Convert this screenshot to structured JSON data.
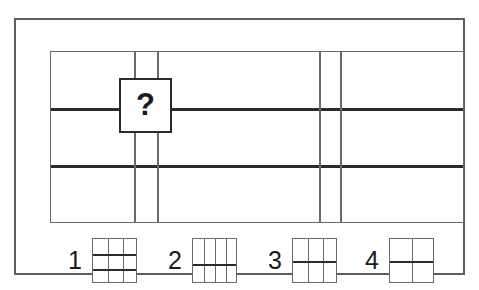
{
  "figure": {
    "type": "matrix-reasoning-puzzle",
    "question_mark": "?",
    "colors": {
      "background": "#ffffff",
      "frame": "#5d5d5d",
      "thin_line": "#6a6a6a",
      "thick_line": "#2b2b2b",
      "text": "#1a1a1a"
    }
  },
  "stimulus": {
    "name": "main-grid",
    "width": 414,
    "height": 172,
    "thick_horizontal_lines": [
      {
        "id": "h1",
        "y": 56
      },
      {
        "id": "h2",
        "y": 113
      }
    ],
    "thin_vertical_lines": [
      {
        "id": "v1",
        "x": 83
      },
      {
        "id": "v2",
        "x": 106
      },
      {
        "id": "v3",
        "x": 268
      },
      {
        "id": "v4",
        "x": 289
      }
    ],
    "question_tile": {
      "label": "?",
      "x": 103,
      "y": 58,
      "width": 53,
      "height": 55
    }
  },
  "answers": [
    {
      "number": "1",
      "columns": 3,
      "rows": 3,
      "thin_vertical_lines": [
        15,
        30
      ],
      "thick_horizontal_lines": [
        15,
        30
      ],
      "left": 14
    },
    {
      "number": "2",
      "columns": 4,
      "rows": 2,
      "thin_vertical_lines": [
        11,
        22,
        33
      ],
      "thick_horizontal_lines": [
        25
      ],
      "left": 114
    },
    {
      "number": "3",
      "columns": 3,
      "rows": 2,
      "thin_vertical_lines": [
        15,
        30
      ],
      "thick_horizontal_lines": [
        22
      ],
      "left": 214
    },
    {
      "number": "4",
      "columns": 2,
      "rows": 2,
      "thin_vertical_lines": [
        22
      ],
      "thick_horizontal_lines": [
        22
      ],
      "left": 311
    }
  ]
}
